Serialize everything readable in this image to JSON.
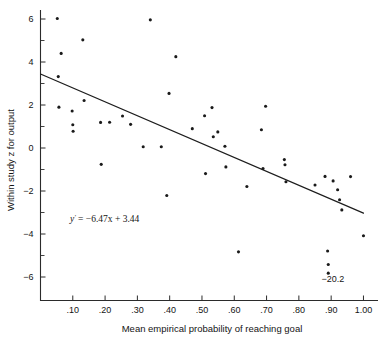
{
  "chart_data": {
    "type": "scatter",
    "title": "",
    "xlabel": "Mean empirical probability of reaching goal",
    "ylabel": "Within study z for output",
    "xlim": [
      0.0,
      1.045
    ],
    "ylim": [
      -6.8,
      6.5
    ],
    "grid": false,
    "legend": null,
    "xticks": [
      ".10",
      ".20",
      ".30",
      ".40",
      ".50",
      ".60",
      ".70",
      ".80",
      ".90",
      "1.00"
    ],
    "xtick_values": [
      0.1,
      0.2,
      0.3,
      0.4,
      0.5,
      0.6,
      0.7,
      0.8,
      0.9,
      1.0
    ],
    "yticks": [
      "6",
      "4",
      "2",
      "0",
      "-2",
      "-4",
      "-6"
    ],
    "ytick_values": [
      6,
      4,
      2,
      0,
      -2,
      -4,
      -6
    ],
    "ytick_minor_values": [
      5,
      3,
      1,
      -1,
      -3,
      -5
    ],
    "points": [
      [
        0.052,
        6.02
      ],
      [
        0.055,
        3.32
      ],
      [
        0.057,
        1.9
      ],
      [
        0.064,
        4.4
      ],
      [
        0.098,
        1.72
      ],
      [
        0.1,
        1.08
      ],
      [
        0.101,
        0.78
      ],
      [
        0.131,
        5.03
      ],
      [
        0.135,
        2.21
      ],
      [
        0.186,
        1.19
      ],
      [
        0.188,
        -0.76
      ],
      [
        0.214,
        1.2
      ],
      [
        0.254,
        1.49
      ],
      [
        0.279,
        1.1
      ],
      [
        0.318,
        0.06
      ],
      [
        0.34,
        5.96
      ],
      [
        0.374,
        0.06
      ],
      [
        0.391,
        -2.21
      ],
      [
        0.398,
        2.54
      ],
      [
        0.419,
        4.25
      ],
      [
        0.47,
        0.9
      ],
      [
        0.508,
        1.5
      ],
      [
        0.511,
        -1.19
      ],
      [
        0.531,
        1.88
      ],
      [
        0.535,
        0.52
      ],
      [
        0.549,
        0.75
      ],
      [
        0.571,
        0.08
      ],
      [
        0.574,
        -0.88
      ],
      [
        0.613,
        -4.83
      ],
      [
        0.639,
        -1.79
      ],
      [
        0.684,
        0.85
      ],
      [
        0.689,
        -0.95
      ],
      [
        0.697,
        1.94
      ],
      [
        0.755,
        -0.54
      ],
      [
        0.757,
        -0.78
      ],
      [
        0.76,
        -1.57
      ],
      [
        0.85,
        -1.72
      ],
      [
        0.881,
        -1.32
      ],
      [
        0.889,
        -4.79
      ],
      [
        0.891,
        -5.42
      ],
      [
        0.891,
        -5.82
      ],
      [
        0.906,
        -1.53
      ],
      [
        0.92,
        -1.94
      ],
      [
        0.926,
        -2.41
      ],
      [
        0.933,
        -2.88
      ],
      [
        0.96,
        -1.33
      ],
      [
        1.0,
        -4.08
      ]
    ],
    "regression": {
      "equation_prefix": "y",
      "equation_superscript": "'",
      "equation_body": "= −6.47x + 3.44",
      "slope": -6.47,
      "intercept": 3.44,
      "x_start": 0.0,
      "x_end": 1.0
    },
    "annotations": [
      {
        "text": "−20.2",
        "x": 0.905,
        "y": -6.25,
        "note": "value label for two off-scale points near x = .89"
      }
    ]
  }
}
